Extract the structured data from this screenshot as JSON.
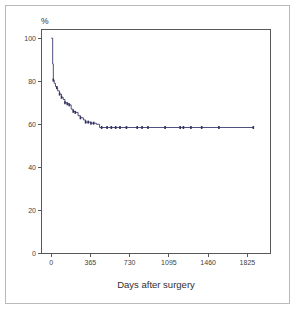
{
  "figure": {
    "name": "kaplan-meier-survival-plot",
    "background": "#ffffff",
    "frame_color": "#b9b9b9"
  },
  "chart_data": {
    "type": "line",
    "title": "",
    "subtitle": "",
    "xlabel": "Days after surgery",
    "ylabel": "%",
    "ylabel_position": "above-y-axis",
    "xlim": [
      -90,
      2040
    ],
    "ylim": [
      0,
      104
    ],
    "grid": false,
    "legend": null,
    "legend_position": "none",
    "curve_color": "#3c3c72",
    "censor_color": "#32325f",
    "axis_color": "#58585a",
    "xticks": [
      0,
      365,
      730,
      1095,
      1460,
      1825
    ],
    "xtick_labels": [
      "0",
      "365",
      "730",
      "1095",
      "1460",
      "1825"
    ],
    "yticks": [
      0,
      20,
      40,
      60,
      80,
      100
    ],
    "ytick_labels": [
      "0",
      "20",
      "40",
      "60",
      "80",
      "100"
    ],
    "series": [
      {
        "name": "Survival probability",
        "style": "step-post",
        "x": [
          0,
          14,
          20,
          28,
          40,
          52,
          60,
          78,
          96,
          112,
          128,
          150,
          168,
          186,
          205,
          224,
          250,
          272,
          300,
          320,
          345,
          370,
          395,
          420,
          450,
          470,
          500,
          520
        ],
        "y": [
          100.0,
          88.0,
          80.5,
          79.0,
          77.5,
          77.0,
          75.5,
          74.0,
          72.5,
          71.5,
          70.0,
          69.5,
          69.0,
          67.0,
          66.0,
          65.5,
          64.0,
          63.0,
          62.0,
          61.0,
          61.0,
          60.5,
          60.5,
          60.0,
          58.5,
          58.5,
          58.5,
          58.5
        ],
        "plateau_value": 58.5,
        "plateau_from_x": 470,
        "final_x": 1880
      }
    ],
    "censored_points": {
      "note": "tick/dot marks on the curve indicating censored observations",
      "x": [
        20,
        52,
        78,
        96,
        128,
        150,
        168,
        205,
        224,
        272,
        320,
        345,
        370,
        395,
        470,
        520,
        560,
        600,
        640,
        700,
        800,
        845,
        900,
        1060,
        1200,
        1230,
        1300,
        1400,
        1560,
        1880
      ],
      "y": [
        80.5,
        77.0,
        74.0,
        72.5,
        70.0,
        69.5,
        69.0,
        66.0,
        65.5,
        63.0,
        61.0,
        61.0,
        60.5,
        60.5,
        58.5,
        58.5,
        58.5,
        58.5,
        58.5,
        58.5,
        58.5,
        58.5,
        58.5,
        58.5,
        58.5,
        58.5,
        58.5,
        58.5,
        58.5,
        58.5
      ]
    }
  }
}
